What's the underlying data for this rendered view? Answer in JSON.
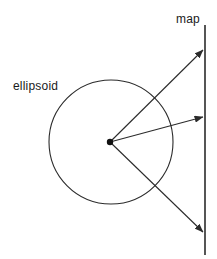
{
  "figure": {
    "type": "geometry-diagram",
    "title": "",
    "background_color": "#ffffff",
    "stroke_color": "#2b2b2b",
    "text_color": "#1a1a1a",
    "width": 217,
    "height": 259
  },
  "labels": {
    "ellipsoid": "ellipsoid",
    "map": "map"
  },
  "label_positions": {
    "ellipsoid": {
      "x": 13,
      "y": 90
    },
    "map": {
      "x": 176,
      "y": 23
    }
  },
  "shapes": {
    "ellipsoid_circle": {
      "name": "ellipsoid",
      "cx": 111,
      "cy": 142,
      "r": 62
    },
    "center_point": {
      "name": "projection-center",
      "cx": 110,
      "cy": 142,
      "r": 3.2
    },
    "map_line": {
      "name": "map-plane",
      "x": 205,
      "y1": 25,
      "y2": 255
    }
  },
  "rays": [
    {
      "name": "upper-ray",
      "x1": 110,
      "y1": 142,
      "x2": 203,
      "y2": 50
    },
    {
      "name": "middle-ray",
      "x1": 110,
      "y1": 142,
      "x2": 203,
      "y2": 117
    },
    {
      "name": "lower-ray",
      "x1": 110,
      "y1": 142,
      "x2": 203,
      "y2": 232
    }
  ]
}
